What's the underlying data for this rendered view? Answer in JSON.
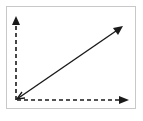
{
  "diagram": {
    "colors": {
      "stroke": "#1a1a1a",
      "frame": "#c8c8c8",
      "background": "#ffffff"
    },
    "arrows": [
      {
        "id": "vertical-axis",
        "style": "dashed",
        "direction": "up"
      },
      {
        "id": "horizontal-axis",
        "style": "dashed",
        "direction": "right"
      },
      {
        "id": "diagonal-vector",
        "style": "solid",
        "direction": "up-right",
        "double_headed": true
      }
    ]
  }
}
